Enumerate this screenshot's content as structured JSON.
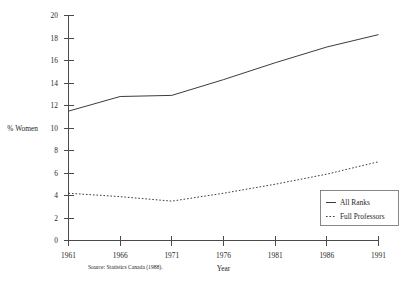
{
  "chart_data": {
    "type": "line",
    "title": "",
    "xlabel": "Year",
    "ylabel": "% Women",
    "x": [
      1961,
      1966,
      1971,
      1976,
      1981,
      1986,
      1991
    ],
    "xlim": [
      1961,
      1991
    ],
    "ylim": [
      0,
      20
    ],
    "xticks": [
      "1961",
      "1966",
      "1971",
      "1976",
      "1981",
      "1986",
      "1991"
    ],
    "yticks": [
      "0",
      "2",
      "4",
      "6",
      "8",
      "10",
      "12",
      "14",
      "16",
      "18",
      "20"
    ],
    "grid": false,
    "legend_position": "bottom-right",
    "series": [
      {
        "name": "All Ranks",
        "style": "solid",
        "values": [
          11.5,
          12.8,
          12.9,
          14.3,
          15.8,
          17.2,
          18.3
        ]
      },
      {
        "name": "Full Professors",
        "style": "dotted",
        "values": [
          4.2,
          3.9,
          3.5,
          4.2,
          5.0,
          5.9,
          7.0
        ]
      }
    ],
    "annotations": {
      "source": "Source: Statistics Canada (1988)."
    }
  },
  "axes": {
    "y_label": "% Women",
    "x_label": "Year",
    "y_tick_labels": [
      "20",
      "18",
      "16",
      "14",
      "12",
      "10",
      "8",
      "6",
      "4",
      "2",
      "0"
    ],
    "x_tick_labels": [
      "1961",
      "1966",
      "1971",
      "1976",
      "1981",
      "1986",
      "1991"
    ]
  },
  "legend": {
    "items": [
      {
        "label": "All Ranks",
        "style": "solid"
      },
      {
        "label": "Full Professors",
        "style": "dotted"
      }
    ]
  },
  "footnote": {
    "source": "Source: Statistics Canada (1988)."
  }
}
